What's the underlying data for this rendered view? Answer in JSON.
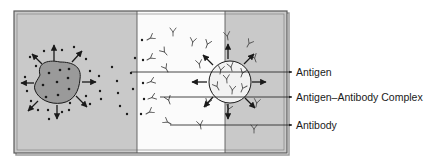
{
  "figure": {
    "colors": {
      "background": "#ffffff",
      "panel_gray": "#c9c9c9",
      "panel_white": "#fbfbfb",
      "frame": "#5a5a5a",
      "cell_fill": "#9a9a9a",
      "ink": "#1a1a1a",
      "antibody_stroke": "#555555"
    },
    "regions": [
      {
        "name": "left-gray-region",
        "x": 14,
        "width": 123
      },
      {
        "name": "center-white-region",
        "x": 137,
        "width": 88
      },
      {
        "name": "right-gray-region",
        "x": 225,
        "width": 62
      }
    ],
    "labels": [
      {
        "id": "antigen",
        "text": "Antigen",
        "y": 72
      },
      {
        "id": "complex",
        "text": "Antigen–Antibody Complex",
        "y": 97
      },
      {
        "id": "antibody",
        "text": "Antibody",
        "y": 125
      }
    ]
  }
}
